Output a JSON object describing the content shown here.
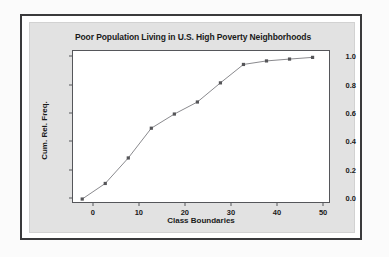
{
  "figure": {
    "panel_background": "#e2e2e2",
    "frame_color": "#3a3a3c",
    "plot_background": "#ffffff",
    "axis_color": "#55565a"
  },
  "chart_data": {
    "type": "line",
    "title": "Poor Population Living in U.S. High Poverty Neighborhoods",
    "xlabel": "Class Boundaries",
    "ylabel": "Cum. Rel. Freq.",
    "xlim": [
      -4.5,
      51.5
    ],
    "ylim": [
      -0.035,
      1.045
    ],
    "grid": false,
    "legend": "none",
    "marker": "square",
    "marker_color": "#555558",
    "line_color": "#8a8a8e",
    "xticks": [
      0,
      10,
      20,
      30,
      40,
      50
    ],
    "xtick_labels": [
      "0",
      "10",
      "20",
      "30",
      "40",
      "50"
    ],
    "yticks": [
      0.0,
      0.2,
      0.4,
      0.6,
      0.8,
      1.0
    ],
    "ytick_labels": [
      "0.0",
      "0.2",
      "0.4",
      "0.6",
      "0.8",
      "1.0"
    ],
    "x": [
      -2.5,
      2.5,
      7.5,
      12.5,
      17.5,
      22.5,
      27.5,
      32.5,
      37.5,
      42.5,
      47.5
    ],
    "y": [
      0.0,
      0.11,
      0.29,
      0.5,
      0.6,
      0.685,
      0.82,
      0.95,
      0.975,
      0.988,
      1.0
    ],
    "points": [
      {
        "x": -2.5,
        "y": 0.0
      },
      {
        "x": 2.5,
        "y": 0.11
      },
      {
        "x": 7.5,
        "y": 0.29
      },
      {
        "x": 12.5,
        "y": 0.5
      },
      {
        "x": 17.5,
        "y": 0.6
      },
      {
        "x": 22.5,
        "y": 0.685
      },
      {
        "x": 27.5,
        "y": 0.82
      },
      {
        "x": 32.5,
        "y": 0.95
      },
      {
        "x": 37.5,
        "y": 0.975
      },
      {
        "x": 42.5,
        "y": 0.988
      },
      {
        "x": 47.5,
        "y": 1.0
      }
    ]
  }
}
